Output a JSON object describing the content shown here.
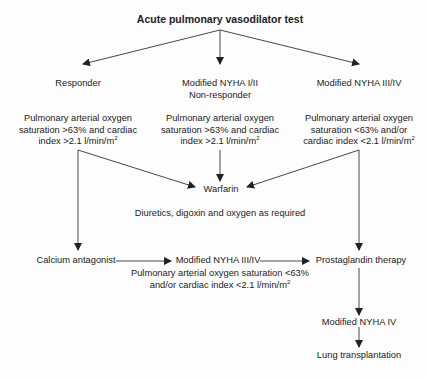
{
  "diagram": {
    "title": "Acute pulmonary vasodilator test",
    "branches": [
      {
        "label": "Responder",
        "criteria_lines": [
          "Pulmonary arterial oxygen",
          "saturation >63% and cardiac",
          "index >2.1 l/min/m",
          "2"
        ]
      },
      {
        "label_lines": [
          "Modified NYHA I/II",
          "Non-responder"
        ],
        "criteria_lines": [
          "Pulmonary arterial oxygen",
          "saturation >63% and cardiac",
          "index >2.1 l/min/m",
          "2"
        ]
      },
      {
        "label": "Modified NYHA III/IV",
        "criteria_lines": [
          "Pulmonary arterial oxygen",
          "saturation <63% and/or",
          "cardiac index <2.1 l/min/m",
          "2"
        ]
      }
    ],
    "warfarin": "Warfarin",
    "supportive": "Diuretics, digoxin and oxygen as required",
    "calcium_antagonist": "Calcium antagonist",
    "mid_nyha": "Modified NYHA III/IV",
    "mid_criteria_lines": [
      "Pulmonary arterial oxygen saturation <63%",
      "and/or cardiac index <2.1 l/min/m",
      "2"
    ],
    "prostaglandin": "Prostaglandin therapy",
    "nyha_iv": "Modified NYHA IV",
    "lung_transplant": "Lung transplantation",
    "colors": {
      "line": "#333333",
      "text": "#222222",
      "background": "#fdfdfd"
    }
  }
}
